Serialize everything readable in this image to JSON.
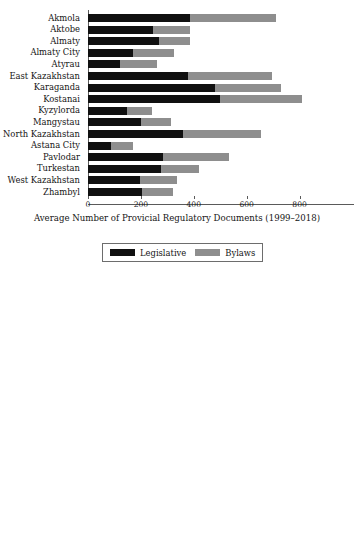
{
  "figure": {
    "legend": {
      "legislative_label": "Legislative",
      "bylaws_label": "Bylaws"
    },
    "colors": {
      "legislative": "#101010",
      "bylaws": "#8e8e8e",
      "axis": "#5a5a5a"
    }
  },
  "chart_data": [
    {
      "type": "bar",
      "orientation": "horizontal",
      "stacked": true,
      "title": "",
      "xlabel": "Average Number of Provicial Regulatory Documents  (1999–2018)",
      "ylabel": "",
      "xlim": [
        0,
        900
      ],
      "ticks": [
        0,
        200,
        400,
        600,
        800
      ],
      "tick_labels": [
        "0",
        "200",
        "400",
        "600",
        "800"
      ],
      "grid": false,
      "legend_position": "bottom",
      "categories": [
        "Akmola",
        "Aktobe",
        "Almaty",
        "Almaty City",
        "Atyrau",
        "East Kazakhstan",
        "Karaganda",
        "Kostanai",
        "Kyzylorda",
        "Mangystau",
        "North Kazakhstan",
        "Astana City",
        "Pavlodar",
        "Turkestan",
        "West Kazakhstan",
        "Zhambyl"
      ],
      "series": [
        {
          "name": "Legislative",
          "values": [
            385,
            245,
            270,
            172,
            122,
            378,
            481,
            498,
            147,
            200,
            358,
            88,
            285,
            275,
            198,
            205
          ]
        },
        {
          "name": "Bylaws",
          "values": [
            325,
            142,
            115,
            155,
            140,
            317,
            249,
            310,
            95,
            115,
            296,
            84,
            250,
            145,
            140,
            118
          ]
        }
      ],
      "totals": [
        710,
        387,
        385,
        327,
        262,
        695,
        730,
        808,
        242,
        315,
        654,
        172,
        535,
        420,
        338,
        323
      ]
    },
    {
      "type": "bar",
      "orientation": "horizontal",
      "stacked": true,
      "title": "",
      "xlabel": "Average Lenght of Provicial Regulatory Documents  (1999–2018)",
      "ylabel": "",
      "xlim": [
        0,
        550000
      ],
      "ticks": [
        0,
        100000,
        200000,
        300000,
        400000,
        500000
      ],
      "tick_labels": [
        "0",
        "100000",
        "200000",
        "300000",
        "400000",
        "500000"
      ],
      "grid": false,
      "legend_position": "bottom",
      "categories": [
        "Akmola",
        "Aktobe",
        "Almaty",
        "Almaty City",
        "Atyrau",
        "East Kazakhstan",
        "Karaganda",
        "Kostanai",
        "Kyzylorda",
        "Mangystau",
        "North Kazakhstan",
        "Astana City",
        "Pavlodar",
        "Turkestan",
        "West Kazakhstan",
        "Zhambyl"
      ],
      "series": [
        {
          "name": "Legislative",
          "values": [
            260000,
            133000,
            150000,
            98000,
            76000,
            213000,
            252000,
            256000,
            97000,
            110000,
            196000,
            50000,
            152000,
            148000,
            113000,
            113000
          ]
        },
        {
          "name": "Bylaws",
          "values": [
            172000,
            62000,
            40000,
            60000,
            51000,
            217000,
            197000,
            262000,
            42000,
            62000,
            160000,
            36000,
            120000,
            77000,
            58000,
            53000
          ]
        }
      ],
      "totals": [
        432000,
        195000,
        190000,
        158000,
        127000,
        430000,
        449000,
        518000,
        139000,
        172000,
        356000,
        86000,
        272000,
        225000,
        171000,
        166000
      ]
    }
  ]
}
